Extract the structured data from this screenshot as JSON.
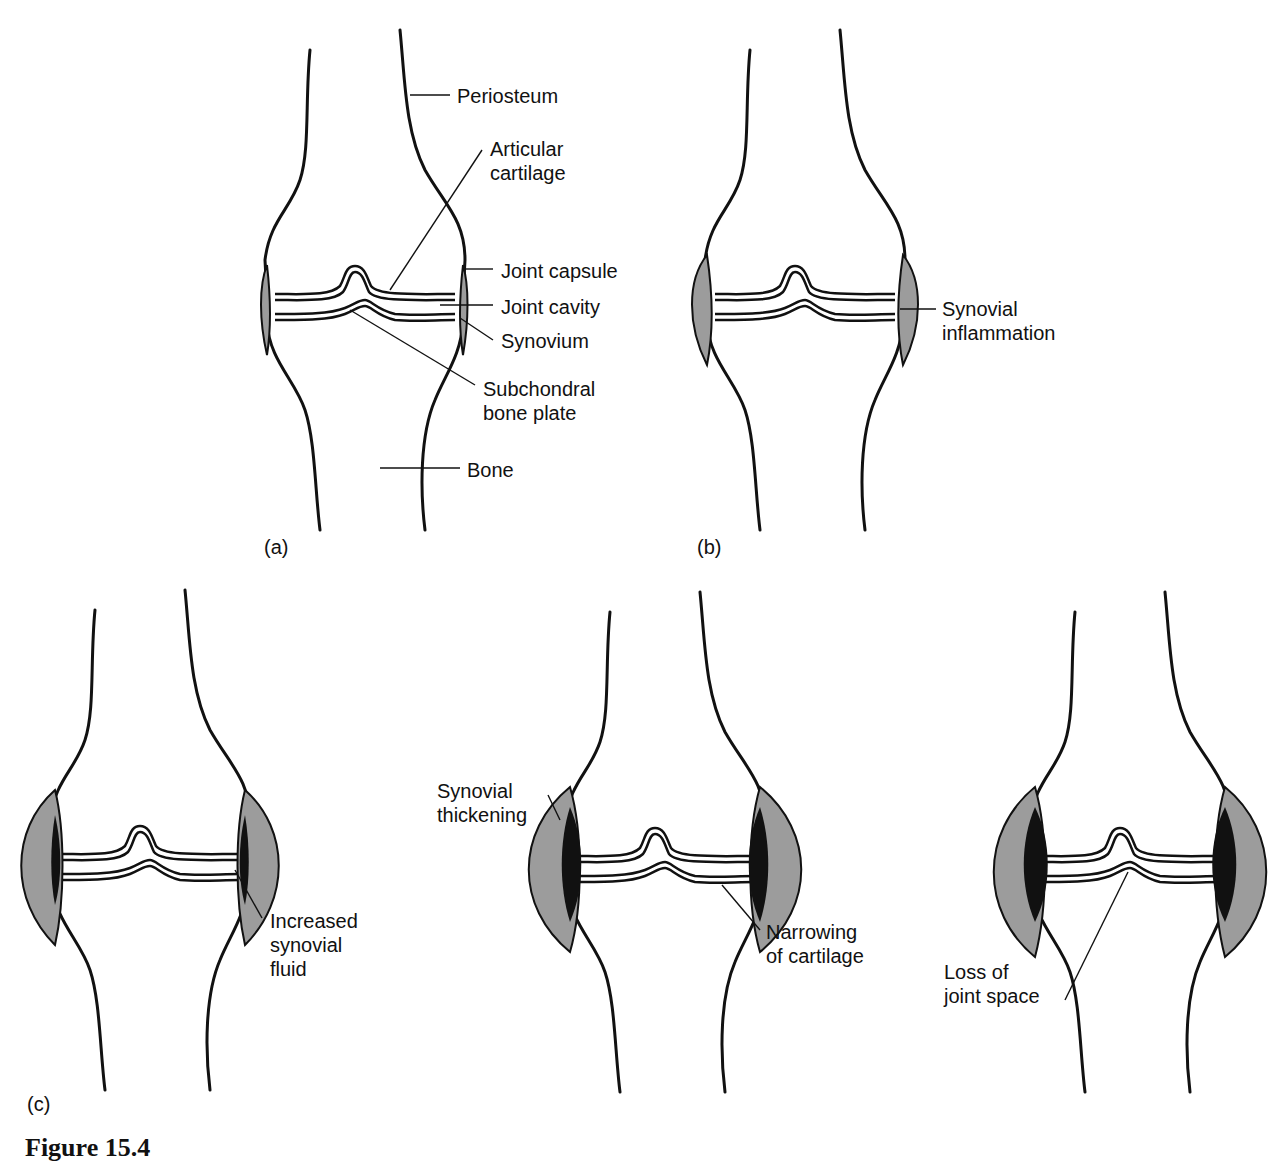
{
  "figure": {
    "caption": "Figure 15.4",
    "panels": [
      {
        "id": "a",
        "label": "(a)",
        "annotations": {
          "periosteum": "Periosteum",
          "articular_cartilage_1": "Articular",
          "articular_cartilage_2": "cartilage",
          "joint_capsule": "Joint capsule",
          "joint_cavity": "Joint cavity",
          "synovium": "Synovium",
          "subchondral_1": "Subchondral",
          "subchondral_2": "bone plate",
          "bone": "Bone"
        }
      },
      {
        "id": "b",
        "label": "(b)",
        "annotations": {
          "synovial_inflammation_1": "Synovial",
          "synovial_inflammation_2": "inflammation"
        }
      },
      {
        "id": "c",
        "label": "(c)",
        "stages": [
          {
            "annotations": {
              "line1": "Increased",
              "line2": "synovial",
              "line3": "fluid"
            }
          },
          {
            "annotations": {
              "thickening_1": "Synovial",
              "thickening_2": "thickening",
              "narrowing_1": "Narrowing",
              "narrowing_2": "of cartilage"
            }
          },
          {
            "annotations": {
              "loss_1": "Loss of",
              "loss_2": "joint space"
            }
          }
        ]
      }
    ]
  }
}
